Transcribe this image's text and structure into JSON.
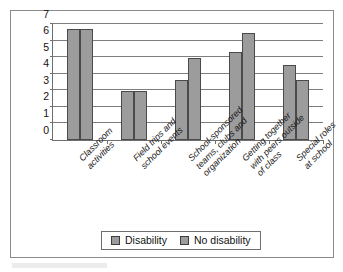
{
  "chart_data": {
    "type": "bar",
    "title": "",
    "subtitle": "",
    "xlabel": "",
    "ylabel": "",
    "ylim": [
      0,
      7
    ],
    "yticks": [
      0,
      1,
      2,
      3,
      4,
      5,
      6,
      7
    ],
    "grid": true,
    "legend_position": "bottom",
    "categories": [
      "Classroom activities",
      "Field trips and school events",
      "School-sponsored teams, clubs and organization",
      "Getting together with peers outside of class",
      "Special roles at school"
    ],
    "category_lines": [
      [
        "Classroom",
        "activities"
      ],
      [
        "Field trips and",
        "school events"
      ],
      [
        "School-sponsored",
        "teams, clubs and",
        "organization"
      ],
      [
        "Getting together",
        "with peers outside",
        "of class"
      ],
      [
        "Special roles",
        "at school"
      ]
    ],
    "series": [
      {
        "name": "Disability",
        "color": "#9c9c9c",
        "values": [
          6.7,
          2.95,
          3.6,
          5.3,
          4.5
        ]
      },
      {
        "name": "No disability",
        "color": "#9c9c9c",
        "values": [
          6.7,
          2.95,
          4.95,
          6.45,
          3.6
        ]
      }
    ]
  },
  "legend": {
    "items": [
      {
        "label": "Disability"
      },
      {
        "label": "No disability"
      }
    ]
  },
  "axis": {
    "y_tick_labels": [
      "0",
      "1",
      "2",
      "3",
      "4",
      "5",
      "6",
      "7"
    ]
  }
}
